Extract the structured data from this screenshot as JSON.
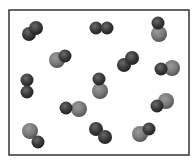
{
  "diagram": {
    "box": {
      "x": 9,
      "y": 10,
      "width": 180,
      "height": 145,
      "stroke": "#333333"
    },
    "colors": {
      "dark": "#3a3a3a",
      "light": "#7a7a7a"
    },
    "molecules": [
      {
        "type": "dark-dark",
        "atoms": [
          {
            "cx": 29,
            "cy": 34,
            "r": 7,
            "color": "dark"
          },
          {
            "cx": 36,
            "cy": 28,
            "r": 7,
            "color": "dark"
          }
        ]
      },
      {
        "type": "dark-dark",
        "atoms": [
          {
            "cx": 96,
            "cy": 28,
            "r": 6.5,
            "color": "dark"
          },
          {
            "cx": 107,
            "cy": 28,
            "r": 6.5,
            "color": "dark"
          }
        ]
      },
      {
        "type": "dark-light",
        "atoms": [
          {
            "cx": 158,
            "cy": 23,
            "r": 6.5,
            "color": "dark"
          },
          {
            "cx": 159,
            "cy": 34,
            "r": 8,
            "color": "light"
          }
        ]
      },
      {
        "type": "dark-light",
        "atoms": [
          {
            "cx": 65,
            "cy": 56,
            "r": 6.5,
            "color": "dark"
          },
          {
            "cx": 57,
            "cy": 60,
            "r": 8,
            "color": "light"
          }
        ]
      },
      {
        "type": "dark-dark",
        "atoms": [
          {
            "cx": 124,
            "cy": 65,
            "r": 7,
            "color": "dark"
          },
          {
            "cx": 132,
            "cy": 58,
            "r": 7,
            "color": "dark"
          }
        ]
      },
      {
        "type": "dark-light",
        "atoms": [
          {
            "cx": 161,
            "cy": 69,
            "r": 6.5,
            "color": "dark"
          },
          {
            "cx": 172,
            "cy": 68,
            "r": 8,
            "color": "light"
          }
        ]
      },
      {
        "type": "dark-dark",
        "atoms": [
          {
            "cx": 27,
            "cy": 80,
            "r": 6.5,
            "color": "dark"
          },
          {
            "cx": 27,
            "cy": 92,
            "r": 6.5,
            "color": "dark"
          }
        ]
      },
      {
        "type": "dark-light",
        "atoms": [
          {
            "cx": 99,
            "cy": 79,
            "r": 6.5,
            "color": "dark"
          },
          {
            "cx": 100,
            "cy": 91,
            "r": 8,
            "color": "light"
          }
        ]
      },
      {
        "type": "dark-light",
        "atoms": [
          {
            "cx": 66,
            "cy": 108,
            "r": 6.5,
            "color": "dark"
          },
          {
            "cx": 79,
            "cy": 109,
            "r": 8,
            "color": "light"
          }
        ]
      },
      {
        "type": "dark-light",
        "atoms": [
          {
            "cx": 157,
            "cy": 106,
            "r": 6.5,
            "color": "dark"
          },
          {
            "cx": 166,
            "cy": 101,
            "r": 8,
            "color": "light"
          }
        ]
      },
      {
        "type": "dark-light",
        "atoms": [
          {
            "cx": 38,
            "cy": 142,
            "r": 6.5,
            "color": "dark"
          },
          {
            "cx": 30,
            "cy": 131,
            "r": 8,
            "color": "light"
          }
        ]
      },
      {
        "type": "dark-dark",
        "atoms": [
          {
            "cx": 96,
            "cy": 129,
            "r": 7,
            "color": "dark"
          },
          {
            "cx": 105,
            "cy": 137,
            "r": 7,
            "color": "dark"
          }
        ]
      },
      {
        "type": "dark-light",
        "atoms": [
          {
            "cx": 149,
            "cy": 129,
            "r": 6.5,
            "color": "dark"
          },
          {
            "cx": 140,
            "cy": 134,
            "r": 8,
            "color": "light"
          }
        ]
      }
    ]
  }
}
